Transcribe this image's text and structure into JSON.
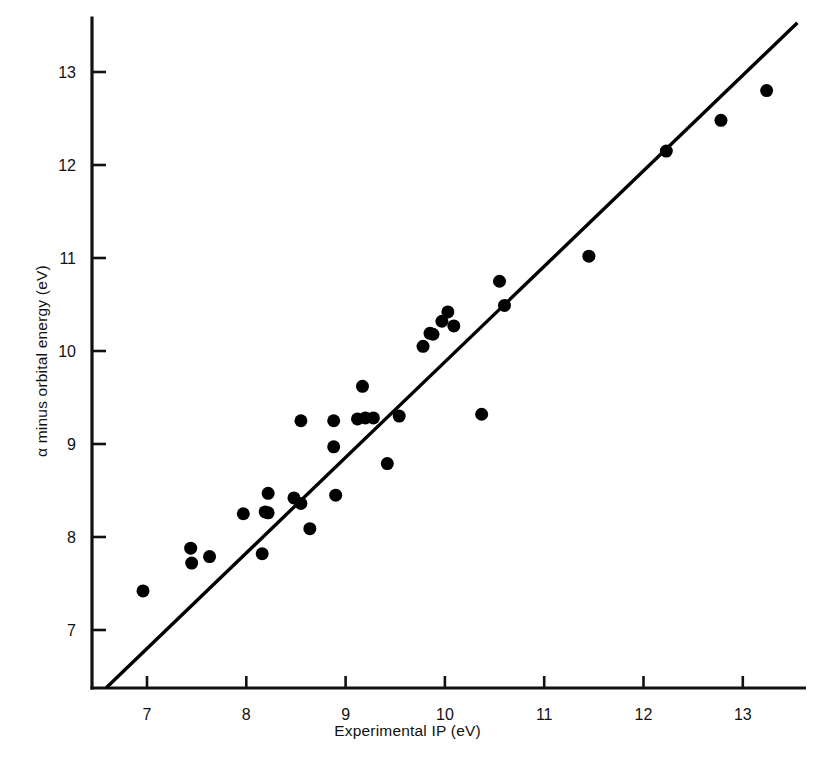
{
  "chart_data": {
    "type": "scatter",
    "title": "",
    "xlabel": "Experimental IP (eV)",
    "ylabel": "α minus orbital energy (eV)",
    "xlim": [
      6.59,
      13.62
    ],
    "ylim": [
      6.38,
      13.58
    ],
    "xticks": [
      7,
      8,
      9,
      10,
      11,
      12,
      13
    ],
    "xticklabels": [
      "7",
      "8",
      "9",
      "10",
      "11",
      "12",
      "13"
    ],
    "yticks": [
      7,
      8,
      9,
      10,
      11,
      12,
      13
    ],
    "yticklabels": [
      "7",
      "8",
      "9",
      "10",
      "11",
      "12",
      "13"
    ],
    "grid": false,
    "legend": null,
    "marker": "filled-circle",
    "marker_color": "#000000",
    "marker_size_px": 13,
    "points": [
      {
        "x": 6.96,
        "y": 7.42
      },
      {
        "x": 7.44,
        "y": 7.88
      },
      {
        "x": 7.45,
        "y": 7.72
      },
      {
        "x": 7.63,
        "y": 7.79
      },
      {
        "x": 7.97,
        "y": 8.25
      },
      {
        "x": 8.16,
        "y": 7.82
      },
      {
        "x": 8.19,
        "y": 8.27
      },
      {
        "x": 8.22,
        "y": 8.26
      },
      {
        "x": 8.22,
        "y": 8.47
      },
      {
        "x": 8.48,
        "y": 8.42
      },
      {
        "x": 8.55,
        "y": 8.36
      },
      {
        "x": 8.55,
        "y": 9.25
      },
      {
        "x": 8.64,
        "y": 8.09
      },
      {
        "x": 8.88,
        "y": 8.97
      },
      {
        "x": 8.88,
        "y": 9.25
      },
      {
        "x": 8.9,
        "y": 8.45
      },
      {
        "x": 9.12,
        "y": 9.27
      },
      {
        "x": 9.17,
        "y": 9.62
      },
      {
        "x": 9.2,
        "y": 9.28
      },
      {
        "x": 9.28,
        "y": 9.28
      },
      {
        "x": 9.42,
        "y": 8.79
      },
      {
        "x": 9.54,
        "y": 9.3
      },
      {
        "x": 9.78,
        "y": 10.05
      },
      {
        "x": 9.85,
        "y": 10.19
      },
      {
        "x": 9.88,
        "y": 10.18
      },
      {
        "x": 9.97,
        "y": 10.32
      },
      {
        "x": 10.03,
        "y": 10.42
      },
      {
        "x": 10.09,
        "y": 10.27
      },
      {
        "x": 10.37,
        "y": 9.32
      },
      {
        "x": 10.55,
        "y": 10.75
      },
      {
        "x": 10.6,
        "y": 10.49
      },
      {
        "x": 11.45,
        "y": 11.02
      },
      {
        "x": 12.23,
        "y": 12.15
      },
      {
        "x": 12.78,
        "y": 12.48
      },
      {
        "x": 13.24,
        "y": 12.8
      }
    ],
    "reference_line": {
      "label": "y = x",
      "from": [
        6.59,
        6.38
      ],
      "to": [
        13.55,
        13.53
      ],
      "color": "#000000",
      "width_px": 3.4
    }
  }
}
